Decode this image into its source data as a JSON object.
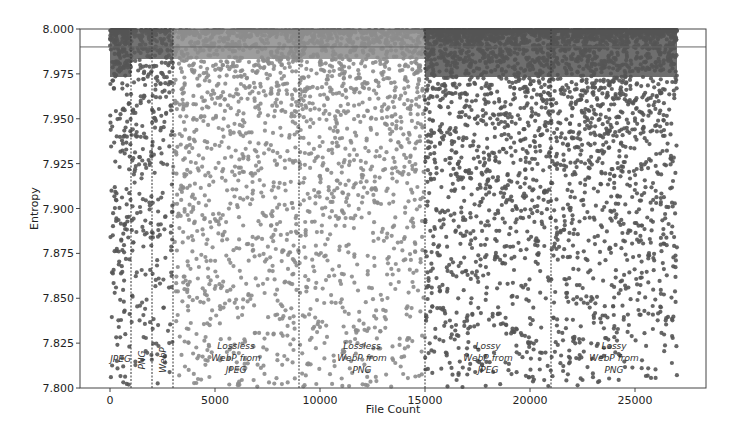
{
  "chart_data": {
    "type": "scatter",
    "title": "",
    "xlabel": "File Count",
    "ylabel": "Entropy",
    "xlim": [
      -1400,
      28500
    ],
    "ylim": [
      7.8,
      8.0
    ],
    "xticks": [
      0,
      5000,
      10000,
      15000,
      20000,
      25000
    ],
    "xtick_labels": [
      "0",
      "5000",
      "10000",
      "15000",
      "20000",
      "25000"
    ],
    "yticks": [
      7.8,
      7.825,
      7.85,
      7.875,
      7.9,
      7.925,
      7.95,
      7.975,
      8.0
    ],
    "ytick_labels": [
      "7.800",
      "7.825",
      "7.850",
      "7.875",
      "7.900",
      "7.925",
      "7.950",
      "7.975",
      "8.000"
    ],
    "grid": false,
    "legend": null,
    "reference_line": {
      "y": 7.99,
      "style": "solid"
    },
    "region_boundaries": [
      1000,
      2000,
      3000,
      9000,
      15000,
      21000
    ],
    "regions": [
      {
        "name": "JPEG",
        "label_lines": [
          "JPEG"
        ],
        "x_start": 0,
        "x_end": 1000,
        "color": "#555555",
        "min_entropy": 7.8,
        "density": "high",
        "rotated": false
      },
      {
        "name": "PNG",
        "label_lines": [
          "PNG"
        ],
        "x_start": 1000,
        "x_end": 2000,
        "color": "#5a5a5a",
        "min_entropy": 7.8,
        "density": "medium",
        "rotated": true
      },
      {
        "name": "WebP",
        "label_lines": [
          "WebP"
        ],
        "x_start": 2000,
        "x_end": 3000,
        "color": "#5a5a5a",
        "min_entropy": 7.8,
        "density": "medium",
        "rotated": true
      },
      {
        "name": "Lossless WebP from JPEG",
        "label_lines": [
          "Lossless",
          "WebP from",
          "JPEG"
        ],
        "x_start": 3000,
        "x_end": 9000,
        "color": "#8c8c8c",
        "min_entropy": 7.8,
        "density": "medium",
        "rotated": false
      },
      {
        "name": "Lossless WebP from PNG",
        "label_lines": [
          "Lossless",
          "WebP from",
          "PNG"
        ],
        "x_start": 9000,
        "x_end": 15000,
        "color": "#8c8c8c",
        "min_entropy": 7.8,
        "density": "medium",
        "rotated": false
      },
      {
        "name": "Lossy WebP from JPEG",
        "label_lines": [
          "Lossy",
          "WebP from",
          "JPEG"
        ],
        "x_start": 15000,
        "x_end": 21000,
        "color": "#555555",
        "min_entropy": 7.8,
        "density": "high",
        "rotated": false
      },
      {
        "name": "Lossy WebP from PNG",
        "label_lines": [
          "Lossy",
          "WebP from",
          "PNG"
        ],
        "x_start": 21000,
        "x_end": 27000,
        "color": "#555555",
        "min_entropy": 7.8,
        "density": "high",
        "rotated": false
      }
    ]
  }
}
